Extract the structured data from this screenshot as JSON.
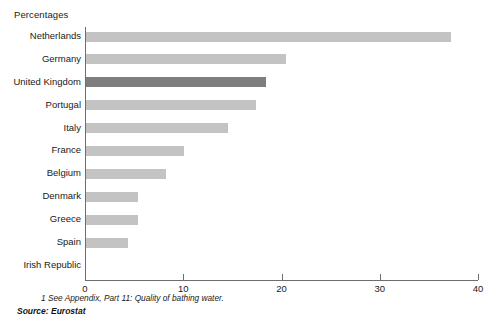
{
  "chart_data": {
    "type": "bar",
    "orientation": "horizontal",
    "title": "",
    "axis_unit_title": "Percentages",
    "xlabel": "",
    "ylabel": "",
    "xlim": [
      0,
      40
    ],
    "xticks": [
      0,
      10,
      20,
      30,
      40
    ],
    "xtick_labels": [
      "0",
      "10",
      "20",
      "30",
      "40"
    ],
    "grid": false,
    "legend": "none",
    "highlight_category": "United Kingdom",
    "categories": [
      "Netherlands",
      "Germany",
      "United Kingdom",
      "Portugal",
      "Italy",
      "France",
      "Belgium",
      "Denmark",
      "Greece",
      "Spain",
      "Irish Republic"
    ],
    "values": [
      37.2,
      20.4,
      18.3,
      17.3,
      14.5,
      10.0,
      8.1,
      5.3,
      5.3,
      4.3,
      0.0
    ],
    "bars": [
      {
        "label": "Netherlands",
        "value": 37.2,
        "highlight": false
      },
      {
        "label": "Germany",
        "value": 20.4,
        "highlight": false
      },
      {
        "label": "United Kingdom",
        "value": 18.3,
        "highlight": true
      },
      {
        "label": "Portugal",
        "value": 17.3,
        "highlight": false
      },
      {
        "label": "Italy",
        "value": 14.5,
        "highlight": false
      },
      {
        "label": "France",
        "value": 10.0,
        "highlight": false
      },
      {
        "label": "Belgium",
        "value": 8.1,
        "highlight": false
      },
      {
        "label": "Denmark",
        "value": 5.3,
        "highlight": false
      },
      {
        "label": "Greece",
        "value": 5.3,
        "highlight": false
      },
      {
        "label": "Spain",
        "value": 4.3,
        "highlight": false
      },
      {
        "label": "Irish Republic",
        "value": 0.0,
        "highlight": false
      }
    ],
    "colors": {
      "bar": "#c3c3c3",
      "bar_highlight": "#7e7e7e",
      "axis": "#6e6e6e",
      "text": "#1a1a1a",
      "background": "#ffffff"
    }
  },
  "footnote": "1  See Appendix, Part 11: Quality of bathing water.",
  "source": "Source: Eurostat"
}
